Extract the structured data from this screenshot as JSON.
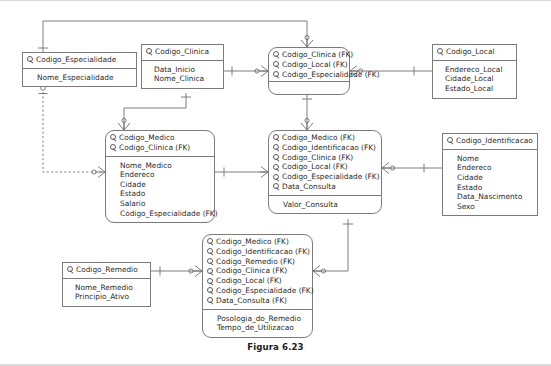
{
  "figure": {
    "caption": "Figura 6.23",
    "line_color": "#6f6f6f",
    "box_border_color": "#7b7b7b",
    "text_color": "#2b2b2b",
    "background": "#ffffff"
  },
  "entities": [
    {
      "id": "especialidade",
      "shape": "rect",
      "keys": [
        {
          "icon": "key-icon",
          "label": "Codigo_Especialidade"
        }
      ],
      "attributes": [
        "Nome_Especialidade"
      ]
    },
    {
      "id": "clinica",
      "shape": "rect",
      "keys": [
        {
          "icon": "key-icon",
          "label": "Codigo_Clinica"
        }
      ],
      "attributes": [
        "Data_Inicio",
        "Nome_Clinica"
      ]
    },
    {
      "id": "especialidade_clinica",
      "shape": "rounded",
      "keys": [
        {
          "icon": "key-icon",
          "label": "Codigo_Clinica (FK)"
        },
        {
          "icon": "key-icon",
          "label": "Codigo_Local (FK)"
        },
        {
          "icon": "key-icon",
          "label": "Codigo_Especialidade (FK)"
        }
      ],
      "attributes": []
    },
    {
      "id": "local",
      "shape": "rect",
      "keys": [
        {
          "icon": "key-icon",
          "label": "Codigo_Local"
        }
      ],
      "attributes": [
        "Endereco_Local",
        "Cidade_Local",
        "Estado_Local"
      ]
    },
    {
      "id": "medico",
      "shape": "rounded",
      "keys": [
        {
          "icon": "key-icon",
          "label": "Codigo_Medico"
        },
        {
          "icon": "key-icon",
          "label": "Codigo_Clinica (FK)"
        }
      ],
      "attributes": [
        "Nome_Medico",
        "Endereco",
        "Cidade",
        "Estado",
        "Salario",
        "Codigo_Especialidade (FK)"
      ]
    },
    {
      "id": "consulta",
      "shape": "rounded",
      "keys": [
        {
          "icon": "key-icon",
          "label": "Codigo_Medico (FK)"
        },
        {
          "icon": "key-icon",
          "label": "Codigo_Identificacao (FK)"
        },
        {
          "icon": "key-icon",
          "label": "Codigo_Clinica (FK)"
        },
        {
          "icon": "key-icon",
          "label": "Codigo_Local (FK)"
        },
        {
          "icon": "key-icon",
          "label": "Codigo_Especialidade (FK)"
        },
        {
          "icon": "key-icon",
          "label": "Data_Consulta"
        }
      ],
      "attributes": [
        "Valor_Consulta"
      ]
    },
    {
      "id": "paciente",
      "shape": "rect",
      "keys": [
        {
          "icon": "key-icon",
          "label": "Codigo_Identificacao"
        }
      ],
      "attributes": [
        "Nome",
        "Endereco",
        "Cidade",
        "Estado",
        "Data_Nascimento",
        "Sexo"
      ]
    },
    {
      "id": "remedio",
      "shape": "rect",
      "keys": [
        {
          "icon": "key-icon",
          "label": "Codigo_Remedio"
        }
      ],
      "attributes": [
        "Nome_Remedio",
        "Principio_Ativo"
      ]
    },
    {
      "id": "prescricao",
      "shape": "rounded",
      "keys": [
        {
          "icon": "key-icon",
          "label": "Codigo_Medico (FK)"
        },
        {
          "icon": "key-icon",
          "label": "Codigo_Identificacao (FK)"
        },
        {
          "icon": "key-icon",
          "label": "Codigo_Remedio (FK)"
        },
        {
          "icon": "key-icon",
          "label": "Codigo_Clinica (FK)"
        },
        {
          "icon": "key-icon",
          "label": "Codigo_Local (FK)"
        },
        {
          "icon": "key-icon",
          "label": "Codigo_Especialidade (FK)"
        },
        {
          "icon": "key-icon",
          "label": "Data_Consulta (FK)"
        }
      ],
      "attributes": [
        "Posologia_do_Remedio",
        "Tempo_de_Utilizacao"
      ]
    }
  ],
  "relationships": [
    {
      "from": "especialidade",
      "to": "especialidade_clinica",
      "style": "solid",
      "from_end": "one",
      "to_end": "many"
    },
    {
      "from": "clinica",
      "to": "especialidade_clinica",
      "style": "solid",
      "from_end": "one",
      "to_end": "many"
    },
    {
      "from": "especialidade_clinica",
      "to": "local",
      "style": "solid",
      "from_end": "zero-or-many",
      "to_end": "one"
    },
    {
      "from": "especialidade",
      "to": "medico",
      "style": "dashed",
      "from_end": "zero-or-one",
      "to_end": "zero-or-many"
    },
    {
      "from": "clinica",
      "to": "medico",
      "style": "solid",
      "from_end": "one",
      "to_end": "many"
    },
    {
      "from": "medico",
      "to": "consulta",
      "style": "solid",
      "from_end": "one",
      "to_end": "many"
    },
    {
      "from": "consulta",
      "to": "paciente",
      "style": "solid",
      "from_end": "zero-or-many",
      "to_end": "one"
    },
    {
      "from": "remedio",
      "to": "prescricao",
      "style": "solid",
      "from_end": "one",
      "to_end": "many"
    },
    {
      "from": "consulta",
      "to": "prescricao",
      "style": "solid",
      "from_end": "one",
      "to_end": "zero-or-many"
    }
  ]
}
